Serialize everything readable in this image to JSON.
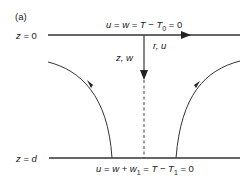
{
  "panel_label": "(a)",
  "top_boundary": {
    "z_label": "z = 0",
    "condition": "u = w = T − T0 = 0",
    "cond_parts": {
      "a": "u",
      "eq1": " = ",
      "b": "w",
      "eq2": " = ",
      "c": "T",
      "minus": " − ",
      "d": "T",
      "sub": "0",
      "tail": " = 0"
    }
  },
  "bottom_boundary": {
    "z_label": "z = d",
    "condition": "u = w + w1 = T − T1 = 0",
    "cond_parts": {
      "a": "u",
      "eq1": " = ",
      "b": "w",
      "plus": " + ",
      "c": "w",
      "sub1": "1",
      "eq2": " = ",
      "d": "T",
      "minus": " − ",
      "e": "T",
      "sub2": "1",
      "tail": " = 0"
    }
  },
  "axes": {
    "radial": "r, u",
    "vertical": "z, w"
  },
  "colors": {
    "line": "#333333",
    "text": "#222222"
  }
}
